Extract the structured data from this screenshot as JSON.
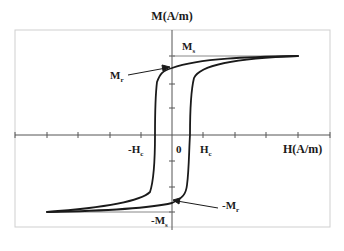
{
  "diagram": {
    "y_axis_label": "M(A/m)",
    "x_axis_label": "H(A/m)",
    "origin_label": "0",
    "labels": {
      "saturation_positive": "M",
      "saturation_positive_sub": "s",
      "remanence_positive": "M",
      "remanence_positive_sub": "r",
      "coercivity_negative": "-H",
      "coercivity_negative_sub": "c",
      "coercivity_positive": "H",
      "coercivity_positive_sub": "c",
      "remanence_negative": "-M",
      "remanence_negative_sub": "r",
      "saturation_negative": "-M",
      "saturation_negative_sub": "s"
    },
    "colors": {
      "curve": "#1a1a1a",
      "axis": "#555555",
      "frame": "#cfcfcf",
      "background": "#ffffff"
    },
    "x_ticks_count": 10,
    "y_ticks_count": 6
  }
}
